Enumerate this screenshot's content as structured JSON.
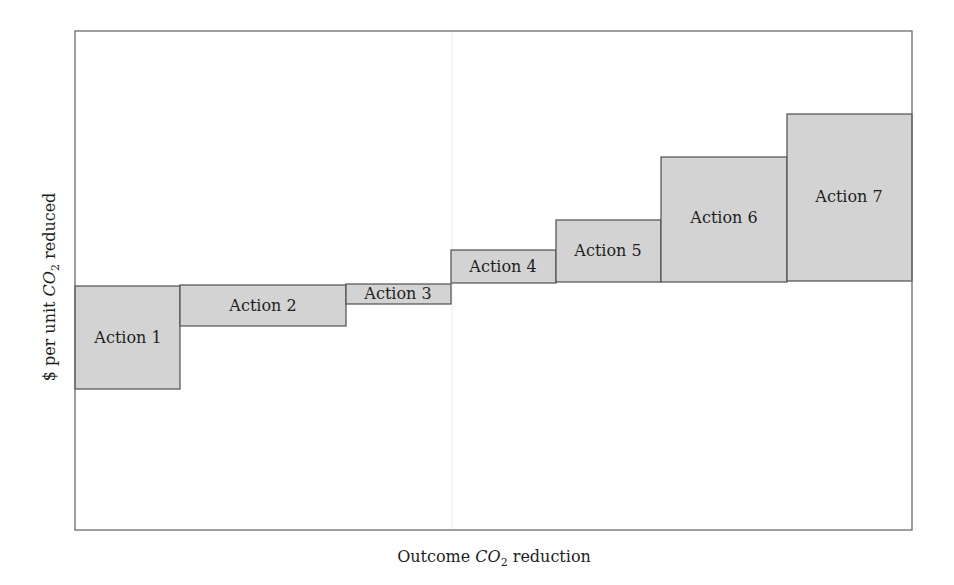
{
  "chart_data": {
    "type": "bar",
    "subtype": "marginal-abatement-cost-curve (variable-width bars)",
    "title": "",
    "xlabel": "Outcome CO2 reduction",
    "xlabel_parts": {
      "prefix": "Outcome ",
      "math": "CO",
      "sub": "2",
      "suffix": " reduction"
    },
    "ylabel": "$ per unit CO2 reduced",
    "ylabel_parts": {
      "prefix": "$ per unit ",
      "math": "CO",
      "sub": "2",
      "suffix": " reduced"
    },
    "axis_ticks": "none",
    "grid": false,
    "legend": "none",
    "colors": {
      "bar_fill": "#d3d3d3",
      "bar_stroke": "#4f4f4f",
      "frame": "#6a6a6a"
    },
    "categories": [
      "Action 1",
      "Action 2",
      "Action 3",
      "Action 4",
      "Action 5",
      "Action 6",
      "Action 7"
    ],
    "series": [
      {
        "name": "Cost per unit CO2 reduced (relative, px above zero line)",
        "values": [
          -104,
          -42,
          -20,
          33,
          62,
          125,
          168
        ]
      },
      {
        "name": "CO2 reduction amount (relative bar width, px)",
        "values": [
          105,
          166,
          105,
          105,
          105,
          126,
          125
        ]
      }
    ],
    "plot_geometry": {
      "frame": {
        "x0": 75,
        "y0": 31,
        "x1": 912,
        "y1": 530
      },
      "zero_y": 283,
      "bars": [
        {
          "label": "Action 1",
          "x0": 75,
          "x1": 180,
          "top": 286,
          "bottom": 389
        },
        {
          "label": "Action 2",
          "x0": 180,
          "x1": 346,
          "top": 285,
          "bottom": 326
        },
        {
          "label": "Action 3",
          "x0": 346,
          "x1": 451,
          "top": 284,
          "bottom": 304
        },
        {
          "label": "Action 4",
          "x0": 451,
          "x1": 556,
          "top": 250,
          "bottom": 283
        },
        {
          "label": "Action 5",
          "x0": 556,
          "x1": 661,
          "top": 220,
          "bottom": 282
        },
        {
          "label": "Action 6",
          "x0": 661,
          "x1": 787,
          "top": 157,
          "bottom": 282
        },
        {
          "label": "Action 7",
          "x0": 787,
          "x1": 912,
          "top": 114,
          "bottom": 281
        }
      ],
      "label_positions": [
        {
          "x": 128,
          "y": 338
        },
        {
          "x": 263,
          "y": 306
        },
        {
          "x": 398,
          "y": 294
        },
        {
          "x": 503,
          "y": 267
        },
        {
          "x": 608,
          "y": 251
        },
        {
          "x": 724,
          "y": 218
        },
        {
          "x": 849,
          "y": 197
        }
      ]
    }
  }
}
